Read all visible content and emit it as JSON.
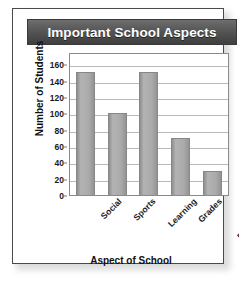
{
  "card": {
    "title": "Important School Aspects"
  },
  "chart_data": {
    "type": "bar",
    "title": "Important School Aspects",
    "xlabel": "Aspect of School",
    "ylabel": "Number of Students",
    "categories": [
      "Social",
      "Sports",
      "Learning",
      "Grades",
      "Preparing for the Future"
    ],
    "category_lines": [
      [
        "Social"
      ],
      [
        "Sports"
      ],
      [
        "Learning"
      ],
      [
        "Grades"
      ],
      [
        "Preparing for",
        "the Future"
      ]
    ],
    "values": [
      150,
      100,
      150,
      70,
      30
    ],
    "ylim": [
      0,
      175
    ],
    "yticks": [
      0,
      20,
      40,
      60,
      80,
      100,
      120,
      140,
      160
    ],
    "grid": true,
    "legend": "none",
    "bar_color": "#aaaaaa",
    "title_bar_color": "#4b4b4b",
    "text_color": "#111111"
  }
}
